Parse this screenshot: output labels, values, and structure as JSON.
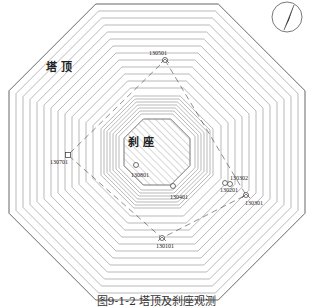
{
  "figure": {
    "caption": "图9-1-2  塔顶及刹座观测",
    "region_labels": {
      "tower_top": "塔 顶",
      "spire_base": "刹 座"
    },
    "north_arrow": "north-arrow",
    "points": [
      {
        "id": "130501",
        "x": 165,
        "y": 60,
        "label_x": 149,
        "label_y": 55,
        "symbol": "triangle-circle"
      },
      {
        "id": "130302",
        "x": 230,
        "y": 184,
        "label_x": 230,
        "label_y": 180,
        "symbol": "circle"
      },
      {
        "id": "130301",
        "x": 246,
        "y": 195,
        "label_x": 245,
        "label_y": 205,
        "symbol": "triangle-circle"
      },
      {
        "id": "130401",
        "x": 173,
        "y": 186,
        "label_x": 170,
        "label_y": 199,
        "symbol": "circle"
      },
      {
        "id": "130801",
        "x": 136,
        "y": 165,
        "label_x": 131,
        "label_y": 177,
        "symbol": "circle"
      },
      {
        "id": "130701",
        "x": 68,
        "y": 155,
        "label_x": 50,
        "label_y": 164,
        "symbol": "square"
      },
      {
        "id": "130201",
        "x": 225,
        "y": 183,
        "label_x": 220,
        "label_y": 192,
        "symbol": "circle"
      },
      {
        "id": "130101",
        "x": 162,
        "y": 238,
        "label_x": 156,
        "label_y": 248,
        "symbol": "triangle-circle"
      }
    ],
    "colors": {
      "line": "#8a8a8a",
      "outer": "#555555",
      "hatch": "#9a9a9a",
      "dash": "#444444"
    }
  }
}
